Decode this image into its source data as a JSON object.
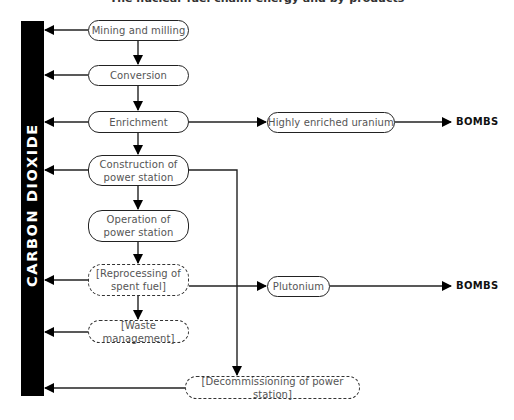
{
  "diagram": {
    "title": "The nuclear fuel chain: energy and by-products",
    "sink": {
      "label": "CARBON DIOXIDE",
      "color": "#000000"
    },
    "main_chain": [
      {
        "id": "mining",
        "label": "Mining and milling",
        "style": "solid",
        "emits_co2": true
      },
      {
        "id": "conversion",
        "label": "Conversion",
        "style": "solid",
        "emits_co2": true
      },
      {
        "id": "enrichment",
        "label": "Enrichment",
        "style": "solid",
        "emits_co2": true
      },
      {
        "id": "construction",
        "label": "Construction of power station",
        "style": "solid",
        "emits_co2": true
      },
      {
        "id": "operation",
        "label": "Operation of power station",
        "style": "solid",
        "emits_co2": false
      },
      {
        "id": "reprocessing",
        "label": "[Reprocessing of spent fuel]",
        "style": "dashed",
        "emits_co2": true
      },
      {
        "id": "waste",
        "label": "[Waste management]",
        "style": "dashed",
        "emits_co2": true
      }
    ],
    "branches": [
      {
        "id": "heu",
        "label": "Highly enriched uranium",
        "from": "enrichment",
        "to": "BOMBS",
        "style": "solid"
      },
      {
        "id": "plutonium",
        "label": "Plutonium",
        "from": "reprocessing",
        "to": "BOMBS",
        "style": "solid"
      },
      {
        "id": "decommissioning",
        "label": "[Decommissioning of power station]",
        "from": "construction",
        "style": "dashed",
        "emits_co2": true
      }
    ],
    "labels": {
      "mining_1": "Mining and milling",
      "conversion_1": "Conversion",
      "enrichment_1": "Enrichment",
      "construction_1": "Construction of",
      "construction_2": "power station",
      "operation_1": "Operation of",
      "operation_2": "power station",
      "reprocessing_1": "[Reprocessing of",
      "reprocessing_2": "spent fuel]",
      "waste_1": "[Waste management]",
      "heu_1": "Highly enriched uranium",
      "plutonium_1": "Plutonium",
      "decommissioning_1": "[Decommissioning of power station]",
      "bombs_1": "BOMBS",
      "bombs_2": "BOMBS",
      "co2": "CARBON DIOXIDE"
    }
  }
}
